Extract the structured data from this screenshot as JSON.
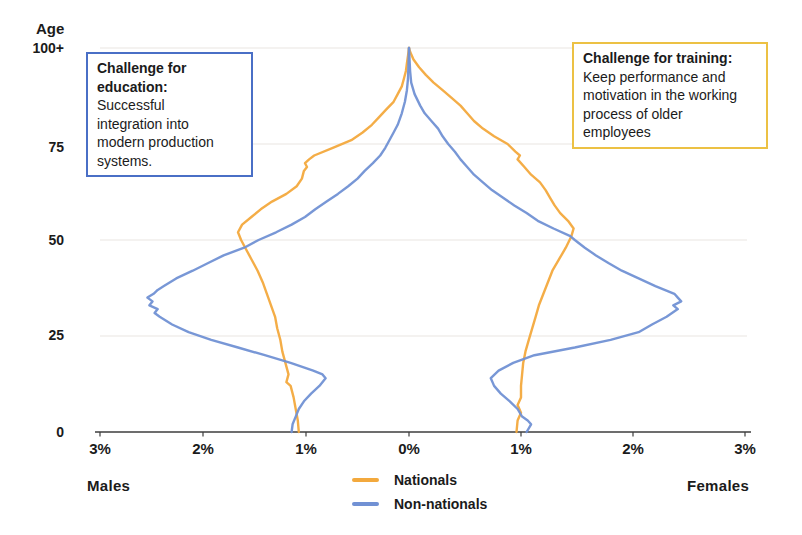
{
  "labels": {
    "age": "Age",
    "males": "Males",
    "females": "Females"
  },
  "y_axis": {
    "ticks": [
      "100+",
      "75",
      "50",
      "25",
      "0"
    ],
    "tick_ages": [
      100,
      75,
      50,
      25,
      0
    ]
  },
  "x_axis": {
    "ticks": [
      {
        "label": "3%",
        "pct": -3
      },
      {
        "label": "2%",
        "pct": -2
      },
      {
        "label": "1%",
        "pct": -1
      },
      {
        "label": "0%",
        "pct": 0
      },
      {
        "label": "1%",
        "pct": 1
      },
      {
        "label": "2%",
        "pct": 2
      },
      {
        "label": "3%",
        "pct": 3
      }
    ]
  },
  "legend": {
    "items": [
      {
        "label": "Nationals",
        "color": "#F3A93D"
      },
      {
        "label": "Non-nationals",
        "color": "#7191D4"
      }
    ]
  },
  "annotations": {
    "education": {
      "title": "Challenge for education:",
      "body": "Successful\nintegration into\nmodern production\nsystems.",
      "border_color": "#4a6fc6"
    },
    "training": {
      "title": "Challenge for training:",
      "body": "Keep performance and\nmotivation in the working\nprocess of older\nemployees",
      "border_color": "#ecc144"
    }
  },
  "chart_data": {
    "type": "line",
    "title": "",
    "xlabel": "% of population",
    "ylabel": "Age",
    "ylim": [
      0,
      100
    ],
    "xlim_males": [
      3,
      0
    ],
    "xlim_females": [
      0,
      3
    ],
    "grid_ages": [
      25,
      50,
      75,
      100
    ],
    "colors": {
      "nationals": "#F3A93D",
      "non_nationals": "#7191D4",
      "axis": "#3d3d3d",
      "grid": "#eae6e1"
    },
    "series": [
      {
        "name": "Nationals",
        "side": "males",
        "color": "#F3A93D",
        "points": [
          [
            0,
            1.07
          ],
          [
            3,
            1.08
          ],
          [
            6,
            1.1
          ],
          [
            9,
            1.12
          ],
          [
            12,
            1.15
          ],
          [
            13,
            1.19
          ],
          [
            15,
            1.17
          ],
          [
            18,
            1.2
          ],
          [
            21,
            1.23
          ],
          [
            24,
            1.25
          ],
          [
            27,
            1.28
          ],
          [
            30,
            1.3
          ],
          [
            33,
            1.34
          ],
          [
            36,
            1.38
          ],
          [
            39,
            1.42
          ],
          [
            42,
            1.47
          ],
          [
            45,
            1.53
          ],
          [
            48,
            1.59
          ],
          [
            50,
            1.63
          ],
          [
            52,
            1.66
          ],
          [
            54,
            1.62
          ],
          [
            56,
            1.53
          ],
          [
            58,
            1.44
          ],
          [
            60,
            1.33
          ],
          [
            62,
            1.19
          ],
          [
            64,
            1.09
          ],
          [
            66,
            1.04
          ],
          [
            68,
            1.02
          ],
          [
            69,
            0.99
          ],
          [
            70,
            1.01
          ],
          [
            71,
            0.97
          ],
          [
            72,
            0.92
          ],
          [
            74,
            0.74
          ],
          [
            76,
            0.56
          ],
          [
            78,
            0.45
          ],
          [
            80,
            0.36
          ],
          [
            82,
            0.29
          ],
          [
            84,
            0.22
          ],
          [
            86,
            0.15
          ],
          [
            88,
            0.11
          ],
          [
            90,
            0.07
          ],
          [
            92,
            0.05
          ],
          [
            94,
            0.03
          ],
          [
            96,
            0.02
          ],
          [
            98,
            0.01
          ],
          [
            100,
            0
          ]
        ]
      },
      {
        "name": "Nationals",
        "side": "females",
        "color": "#F3A93D",
        "points": [
          [
            0,
            0.96
          ],
          [
            3,
            0.97
          ],
          [
            5,
            1.0
          ],
          [
            7,
            0.97
          ],
          [
            9,
            1.0
          ],
          [
            12,
            1.0
          ],
          [
            15,
            1.01
          ],
          [
            18,
            1.02
          ],
          [
            21,
            1.04
          ],
          [
            24,
            1.07
          ],
          [
            27,
            1.1
          ],
          [
            30,
            1.13
          ],
          [
            33,
            1.16
          ],
          [
            36,
            1.2
          ],
          [
            39,
            1.24
          ],
          [
            42,
            1.28
          ],
          [
            45,
            1.34
          ],
          [
            48,
            1.4
          ],
          [
            51,
            1.45
          ],
          [
            53,
            1.47
          ],
          [
            55,
            1.42
          ],
          [
            57,
            1.35
          ],
          [
            59,
            1.3
          ],
          [
            61,
            1.26
          ],
          [
            63,
            1.22
          ],
          [
            65,
            1.17
          ],
          [
            67,
            1.09
          ],
          [
            69,
            1.03
          ],
          [
            71,
            0.97
          ],
          [
            72,
            0.99
          ],
          [
            73,
            0.95
          ],
          [
            75,
            0.88
          ],
          [
            77,
            0.76
          ],
          [
            79,
            0.66
          ],
          [
            81,
            0.58
          ],
          [
            83,
            0.52
          ],
          [
            85,
            0.46
          ],
          [
            87,
            0.38
          ],
          [
            89,
            0.3
          ],
          [
            91,
            0.22
          ],
          [
            93,
            0.15
          ],
          [
            95,
            0.09
          ],
          [
            97,
            0.04
          ],
          [
            99,
            0.01
          ],
          [
            100,
            0
          ]
        ]
      },
      {
        "name": "Non-nationals",
        "side": "males",
        "color": "#7191D4",
        "points": [
          [
            0,
            1.14
          ],
          [
            2,
            1.13
          ],
          [
            4,
            1.1
          ],
          [
            6,
            1.07
          ],
          [
            8,
            1.02
          ],
          [
            10,
            0.95
          ],
          [
            12,
            0.87
          ],
          [
            14,
            0.81
          ],
          [
            15,
            0.84
          ],
          [
            16,
            0.93
          ],
          [
            18,
            1.15
          ],
          [
            20,
            1.4
          ],
          [
            22,
            1.66
          ],
          [
            24,
            1.92
          ],
          [
            26,
            2.14
          ],
          [
            28,
            2.3
          ],
          [
            30,
            2.42
          ],
          [
            31,
            2.47
          ],
          [
            32,
            2.44
          ],
          [
            33,
            2.52
          ],
          [
            34,
            2.49
          ],
          [
            35,
            2.54
          ],
          [
            36,
            2.48
          ],
          [
            37,
            2.44
          ],
          [
            38,
            2.38
          ],
          [
            40,
            2.26
          ],
          [
            42,
            2.1
          ],
          [
            44,
            1.95
          ],
          [
            46,
            1.8
          ],
          [
            48,
            1.6
          ],
          [
            50,
            1.46
          ],
          [
            52,
            1.29
          ],
          [
            54,
            1.14
          ],
          [
            56,
            1.01
          ],
          [
            58,
            0.91
          ],
          [
            60,
            0.8
          ],
          [
            62,
            0.69
          ],
          [
            64,
            0.59
          ],
          [
            66,
            0.5
          ],
          [
            68,
            0.43
          ],
          [
            70,
            0.35
          ],
          [
            72,
            0.28
          ],
          [
            74,
            0.23
          ],
          [
            76,
            0.19
          ],
          [
            78,
            0.15
          ],
          [
            80,
            0.11
          ],
          [
            83,
            0.07
          ],
          [
            86,
            0.04
          ],
          [
            89,
            0.02
          ],
          [
            92,
            0.01
          ],
          [
            100,
            0
          ]
        ]
      },
      {
        "name": "Non-nationals",
        "side": "females",
        "color": "#7191D4",
        "points": [
          [
            0,
            1.05
          ],
          [
            2,
            1.09
          ],
          [
            3,
            1.06
          ],
          [
            4,
            1.01
          ],
          [
            6,
            0.97
          ],
          [
            8,
            0.9
          ],
          [
            10,
            0.82
          ],
          [
            12,
            0.76
          ],
          [
            14,
            0.73
          ],
          [
            16,
            0.8
          ],
          [
            18,
            0.93
          ],
          [
            20,
            1.12
          ],
          [
            22,
            1.48
          ],
          [
            24,
            1.8
          ],
          [
            26,
            2.05
          ],
          [
            28,
            2.17
          ],
          [
            30,
            2.3
          ],
          [
            32,
            2.4
          ],
          [
            33,
            2.36
          ],
          [
            34,
            2.43
          ],
          [
            35,
            2.4
          ],
          [
            36,
            2.37
          ],
          [
            38,
            2.2
          ],
          [
            40,
            2.05
          ],
          [
            42,
            1.9
          ],
          [
            44,
            1.78
          ],
          [
            46,
            1.67
          ],
          [
            48,
            1.57
          ],
          [
            50,
            1.48
          ],
          [
            51,
            1.44
          ],
          [
            53,
            1.29
          ],
          [
            55,
            1.15
          ],
          [
            57,
            1.05
          ],
          [
            59,
            0.94
          ],
          [
            61,
            0.84
          ],
          [
            63,
            0.74
          ],
          [
            65,
            0.66
          ],
          [
            67,
            0.58
          ],
          [
            69,
            0.52
          ],
          [
            71,
            0.46
          ],
          [
            73,
            0.41
          ],
          [
            75,
            0.35
          ],
          [
            77,
            0.3
          ],
          [
            79,
            0.26
          ],
          [
            81,
            0.2
          ],
          [
            83,
            0.14
          ],
          [
            85,
            0.1
          ],
          [
            88,
            0.05
          ],
          [
            91,
            0.02
          ],
          [
            94,
            0.01
          ],
          [
            100,
            0
          ]
        ]
      }
    ]
  }
}
